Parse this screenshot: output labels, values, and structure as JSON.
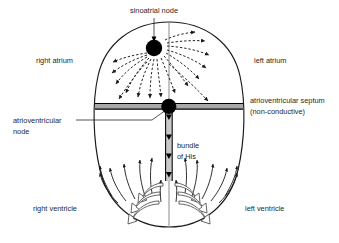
{
  "diagram": {
    "labels": {
      "sinoatrial_node": "sinoatrial node",
      "right_atrium": "right atrium",
      "left_atrium": "left atrium",
      "atrioventricular_septum_line1": "atrioventricular septum",
      "atrioventricular_septum_line2": "(non-conductive)",
      "atrioventricular_node_line1": "atrioventricular",
      "atrioventricular_node_line2": "node",
      "bundle_of_his_line1": "bundle",
      "bundle_of_his_line2": "of His",
      "right_ventricle": "right ventricle",
      "left_ventricle": "left ventricle"
    },
    "colors": {
      "background": "#ffffff",
      "outline": "#1a1a1a",
      "text": "#1f1f1f",
      "node_fill": "#000000",
      "septum_fill": "#a9a9a9",
      "septum_border": "#000000",
      "bundle_fill": "#c9c9c9",
      "arrow_atrial": "#1a1a1a",
      "arrow_ventricular": "#1a1a1a",
      "purkinje_outline": "#4a4a4a",
      "purkinje_fill": "#ffffff"
    },
    "structures": {
      "heart_outline": "egg-shaped ellipse",
      "midline": "vertical centre line",
      "sinoatrial_node_shape": "filled black circle, upper left of midline",
      "atrioventricular_node_shape": "filled black circle on septum at midline",
      "septum_shape": "horizontal grey band across heart",
      "bundle_of_his_shape": "vertical grey channel with downward triangles",
      "atrial_conduction": "dashed curved arrows radiating from sinoatrial node",
      "ventricular_conduction": "solid curved arrows sweeping up and outward from apex",
      "purkinje_arrows": "hollow outlined curved arrows at apex"
    },
    "counts": {
      "atrial_arrows": 16,
      "ventricular_arrows": 14,
      "bundle_triangles": 4,
      "purkinje_arrow_pairs": 3
    }
  }
}
